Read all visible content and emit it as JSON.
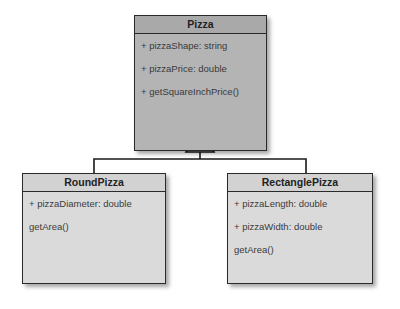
{
  "diagram": {
    "type": "uml-class-diagram",
    "classes": [
      {
        "id": "pizza",
        "name": "Pizza",
        "members": [
          "+ pizzaShape: string",
          "+ pizzaPrice: double",
          "+ getSquareInchPrice()"
        ]
      },
      {
        "id": "round",
        "name": "RoundPizza",
        "members": [
          "+ pizzaDiameter: double",
          "getArea()"
        ]
      },
      {
        "id": "rect",
        "name": "RectanglePizza",
        "members": [
          "+ pizzaLength: double",
          "+ pizzaWidth: double",
          "getArea()"
        ]
      }
    ],
    "relations": [
      {
        "type": "generalization",
        "from": "RoundPizza",
        "to": "Pizza"
      },
      {
        "type": "generalization",
        "from": "RectanglePizza",
        "to": "Pizza"
      }
    ],
    "colors": {
      "parent_fill": "#b4b4b4",
      "child_fill": "#dadada",
      "border": "#2a2a2a"
    }
  }
}
